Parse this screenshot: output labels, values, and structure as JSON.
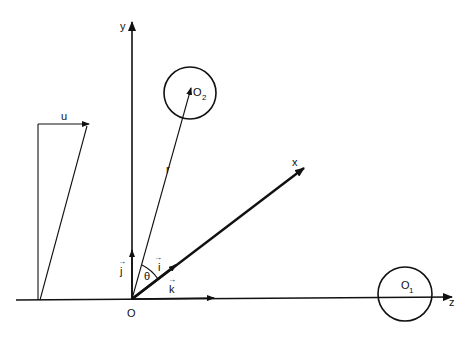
{
  "diagram": {
    "axes": {
      "y": {
        "label": "y"
      },
      "x": {
        "label": "x"
      },
      "z": {
        "label": "z"
      }
    },
    "origin": {
      "label": "O"
    },
    "unit_vectors": {
      "i": {
        "label": "i",
        "arrow": "→"
      },
      "j": {
        "label": "j",
        "arrow": "→"
      },
      "k": {
        "label": "k",
        "arrow": "→"
      }
    },
    "angle": {
      "label": "θ"
    },
    "vectors": {
      "r": {
        "label": "r"
      },
      "u": {
        "label": "u"
      }
    },
    "bodies": {
      "o1": {
        "label": "O",
        "subscript": "1"
      },
      "o2": {
        "label": "O",
        "subscript": "2"
      }
    },
    "colors": {
      "ink": "#111111",
      "background": "#ffffff"
    }
  }
}
